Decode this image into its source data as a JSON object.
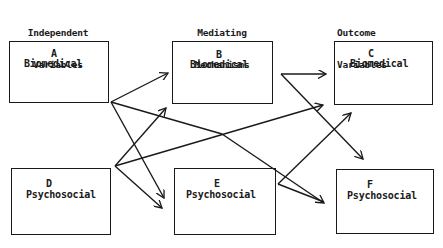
{
  "columns": [
    {
      "id": "independent",
      "title_line1": "Independent",
      "title_line2": "Variables"
    },
    {
      "id": "mediating",
      "title_line1": "Mediating",
      "title_line2": "Mechanisms"
    },
    {
      "id": "outcome",
      "title_line1": "Outcome",
      "title_line2": "Variables"
    }
  ],
  "boxes": [
    {
      "id": "A",
      "letter": "A",
      "label": "Biomedical",
      "column": "independent"
    },
    {
      "id": "B",
      "letter": "B",
      "label": "Biomedical",
      "column": "mediating"
    },
    {
      "id": "C",
      "letter": "C",
      "label": "Biomedical",
      "column": "outcome"
    },
    {
      "id": "D",
      "letter": "D",
      "label": "Psychosocial",
      "column": "independent"
    },
    {
      "id": "E",
      "letter": "E",
      "label": "Psychosocial",
      "column": "mediating"
    },
    {
      "id": "F",
      "letter": "F",
      "label": "Psychosocial",
      "column": "outcome"
    }
  ],
  "edges": [
    {
      "from": "A",
      "to": "B"
    },
    {
      "from": "A",
      "to": "E"
    },
    {
      "from": "A",
      "to": "F"
    },
    {
      "from": "D",
      "to": "B"
    },
    {
      "from": "D",
      "to": "E"
    },
    {
      "from": "D",
      "to": "C"
    },
    {
      "from": "B",
      "to": "C"
    },
    {
      "from": "B",
      "to": "F"
    },
    {
      "from": "E",
      "to": "C"
    },
    {
      "from": "E",
      "to": "F"
    }
  ],
  "colors": {
    "line": "#1a1a1a",
    "background": "#ffffff"
  }
}
